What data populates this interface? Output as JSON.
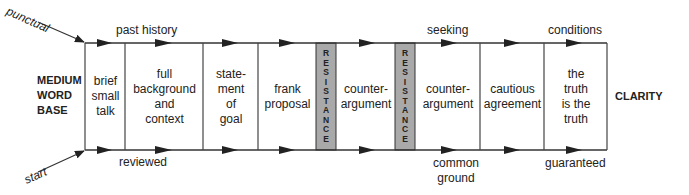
{
  "diagram": {
    "start_label": "MEDIUM WORD BASE",
    "start_lines": [
      "MEDIUM",
      "WORD",
      "BASE"
    ],
    "end_label": "CLARITY",
    "entry_top": "punctual",
    "entry_bottom": "start",
    "stages": [
      {
        "id": "brief-small-talk",
        "lines": [
          "brief",
          "small",
          "talk"
        ]
      },
      {
        "id": "full-background",
        "lines": [
          "full",
          "background",
          "and",
          "context"
        ]
      },
      {
        "id": "statement-of-goal",
        "lines": [
          "state-",
          "ment",
          "of",
          "goal"
        ]
      },
      {
        "id": "frank-proposal",
        "lines": [
          "frank",
          "proposal"
        ]
      },
      {
        "id": "resistance-1",
        "text": "RESISTANCE",
        "resistance": true
      },
      {
        "id": "counter-argument-1",
        "lines": [
          "counter-",
          "argument"
        ]
      },
      {
        "id": "resistance-2",
        "text": "RESISTANCE",
        "resistance": true
      },
      {
        "id": "counter-argument-2",
        "lines": [
          "counter-",
          "argument"
        ]
      },
      {
        "id": "cautious-agreement",
        "lines": [
          "cautious",
          "agreement"
        ]
      },
      {
        "id": "truth",
        "lines": [
          "the",
          "truth",
          "is the",
          "truth"
        ]
      }
    ],
    "top_annotations": [
      {
        "text": "past history"
      },
      {
        "text": "seeking"
      },
      {
        "text": "conditions"
      }
    ],
    "bottom_annotations": [
      {
        "text": "reviewed"
      },
      {
        "text": "common",
        "text2": "ground"
      },
      {
        "text": "guaranteed"
      }
    ],
    "colors": {
      "line": "#333333",
      "resistance_fill": "#a9a9a9"
    }
  }
}
